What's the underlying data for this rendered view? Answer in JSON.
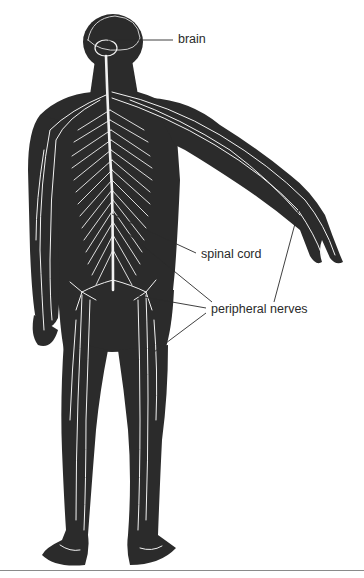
{
  "figure": {
    "colors": {
      "body": "#2b2b2b",
      "nerves": "#f2f2f2",
      "leader_lines": "#2a2a2a",
      "background": "#ffffff"
    }
  },
  "labels": {
    "brain": "brain",
    "spinal_cord": "spinal cord",
    "peripheral_nerves": "peripheral nerves"
  }
}
